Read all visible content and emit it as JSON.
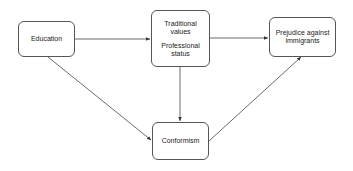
{
  "nodes": {
    "education": {
      "label": "Education"
    },
    "traditional": {
      "line1": "Traditional",
      "line2": "values",
      "line3": "Professional",
      "line4": "status"
    },
    "prejudice": {
      "line1": "Prejudice against",
      "line2": "immigrants"
    },
    "conformism": {
      "label": "Conformism"
    }
  },
  "edges": [
    {
      "from": "Education",
      "to": "Traditional values / Professional status"
    },
    {
      "from": "Traditional values / Professional status",
      "to": "Prejudice against immigrants"
    },
    {
      "from": "Traditional values / Professional status",
      "to": "Conformism"
    },
    {
      "from": "Education",
      "to": "Conformism"
    },
    {
      "from": "Conformism",
      "to": "Prejudice against immigrants"
    }
  ],
  "colors": {
    "line": "#444444",
    "border": "#555555"
  }
}
